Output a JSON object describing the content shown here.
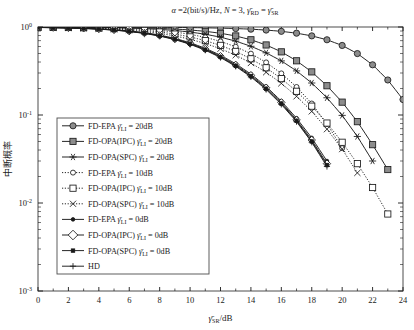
{
  "chart_data": {
    "type": "line",
    "title": "α =2(bit/s)/Hz, N = 3, γ̄RD = γ̄SR",
    "title_parts": {
      "alpha": "α",
      "rate": "=2(bit/s)/Hz,",
      "n": "N = 3,",
      "gamma_rd": "γ",
      "sub_rd": "RD",
      "eq": "=",
      "gamma_sr": "γ",
      "sub_sr": "SR"
    },
    "xlabel": "γ̄SR/dB",
    "xlabel_parts": {
      "gamma": "γ",
      "sub": "SR",
      "unit": "/dB"
    },
    "ylabel": "中断概率",
    "xlim": [
      0,
      24
    ],
    "ylim": [
      0.001,
      1
    ],
    "yscale": "log",
    "xticks": [
      0,
      2,
      4,
      6,
      8,
      10,
      12,
      14,
      16,
      18,
      20,
      22,
      24
    ],
    "xticklabels": [
      "0",
      "2",
      "4",
      "6",
      "8",
      "10",
      "12",
      "14",
      "16",
      "18",
      "20",
      "22",
      "24"
    ],
    "yticks": [
      1,
      0.1,
      0.01,
      0.001
    ],
    "yticklabels": [
      "10^0",
      "10^-1",
      "10^-2",
      "10^-3"
    ],
    "grid": false,
    "legend_position": "lower-left",
    "series": [
      {
        "name": "FD-EPA γ̄LI = 20dB",
        "label_prefix": "FD-EPA",
        "label_gamma": "γ",
        "label_sub": "LI",
        "label_value": "= 20dB",
        "marker": "circle-filled",
        "linestyle": "solid",
        "color": "#1a1a1a",
        "x": [
          0,
          1,
          2,
          3,
          4,
          5,
          6,
          7,
          8,
          9,
          10,
          11,
          12,
          13,
          14,
          15,
          16,
          17,
          18,
          19,
          20,
          21,
          22,
          23,
          24
        ],
        "y": [
          0.999,
          0.999,
          0.998,
          0.998,
          0.997,
          0.996,
          0.995,
          0.993,
          0.991,
          0.988,
          0.984,
          0.979,
          0.971,
          0.96,
          0.945,
          0.923,
          0.893,
          0.851,
          0.793,
          0.716,
          0.617,
          0.499,
          0.372,
          0.25,
          0.15
        ]
      },
      {
        "name": "FD-OPA(IPC) γ̄LI = 20dB",
        "label_prefix": "FD-OPA(IPC)",
        "label_gamma": "γ",
        "label_sub": "LI",
        "label_value": "= 20dB",
        "marker": "square-filled",
        "linestyle": "solid",
        "color": "#1a1a1a",
        "x": [
          0,
          1,
          2,
          3,
          4,
          5,
          6,
          7,
          8,
          9,
          10,
          11,
          12,
          13,
          14,
          15,
          16,
          17,
          18,
          19,
          20,
          21,
          22,
          23
        ],
        "y": [
          0.998,
          0.997,
          0.996,
          0.994,
          0.992,
          0.988,
          0.983,
          0.975,
          0.964,
          0.948,
          0.925,
          0.893,
          0.849,
          0.791,
          0.716,
          0.625,
          0.522,
          0.413,
          0.309,
          0.215,
          0.14,
          0.084,
          0.046,
          0.024
        ]
      },
      {
        "name": "FD-OPA(SPC) γ̄LI = 20dB",
        "label_prefix": "FD-OPA(SPC)",
        "label_gamma": "γ",
        "label_sub": "LI",
        "label_value": "= 20dB",
        "marker": "star",
        "linestyle": "solid",
        "color": "#1a1a1a",
        "x": [
          0,
          1,
          2,
          3,
          4,
          5,
          6,
          7,
          8,
          9,
          10,
          11,
          12,
          13,
          14,
          15,
          16,
          17,
          18,
          19,
          20,
          21,
          22
        ],
        "y": [
          0.997,
          0.996,
          0.994,
          0.991,
          0.987,
          0.981,
          0.972,
          0.959,
          0.94,
          0.913,
          0.876,
          0.828,
          0.766,
          0.691,
          0.604,
          0.509,
          0.412,
          0.317,
          0.231,
          0.157,
          0.099,
          0.057,
          0.03
        ]
      },
      {
        "name": "FD-EPA γ̄LI = 10dB",
        "label_prefix": "FD-EPA",
        "label_gamma": "γ",
        "label_sub": "LI",
        "label_value": "= 10dB",
        "marker": "circle-open",
        "linestyle": "dotted",
        "color": "#1a1a1a",
        "x": [
          0,
          1,
          2,
          3,
          4,
          5,
          6,
          7,
          8,
          9,
          10,
          11,
          12,
          13,
          14,
          15,
          16,
          17,
          18,
          19,
          20
        ],
        "y": [
          0.996,
          0.994,
          0.991,
          0.987,
          0.981,
          0.972,
          0.959,
          0.94,
          0.913,
          0.876,
          0.827,
          0.763,
          0.686,
          0.596,
          0.498,
          0.396,
          0.297,
          0.208,
          0.135,
          0.079,
          0.042
        ]
      },
      {
        "name": "FD-OPA(IPC) γ̄LI = 10dB",
        "label_prefix": "FD-OPA(IPC)",
        "label_gamma": "γ",
        "label_sub": "LI",
        "label_value": "= 10dB",
        "marker": "square-open",
        "linestyle": "dotted",
        "color": "#1a1a1a",
        "x": [
          0,
          1,
          2,
          3,
          4,
          5,
          6,
          7,
          8,
          9,
          10,
          11,
          12,
          13,
          14,
          15,
          16,
          17,
          18,
          19,
          20,
          21,
          22,
          23
        ],
        "y": [
          0.994,
          0.991,
          0.987,
          0.981,
          0.972,
          0.959,
          0.94,
          0.914,
          0.878,
          0.831,
          0.772,
          0.7,
          0.618,
          0.528,
          0.435,
          0.344,
          0.259,
          0.186,
          0.126,
          0.081,
          0.049,
          0.028,
          0.015,
          0.0075
        ]
      },
      {
        "name": "FD-OPA(SPC) γ̄LI = 10dB",
        "label_prefix": "FD-OPA(SPC)",
        "label_gamma": "γ",
        "label_sub": "LI",
        "label_value": "= 10dB",
        "marker": "x-cross",
        "linestyle": "dotted",
        "color": "#1a1a1a",
        "x": [
          0,
          1,
          2,
          3,
          4,
          5,
          6,
          7,
          8,
          9,
          10,
          11,
          12,
          13,
          14,
          15,
          16,
          17,
          18,
          19,
          20,
          21
        ],
        "y": [
          0.992,
          0.988,
          0.982,
          0.974,
          0.962,
          0.945,
          0.921,
          0.889,
          0.846,
          0.792,
          0.726,
          0.65,
          0.566,
          0.478,
          0.39,
          0.306,
          0.229,
          0.163,
          0.11,
          0.069,
          0.041,
          0.022
        ]
      },
      {
        "name": "FD-EPA γ̄LI = 0dB",
        "label_prefix": "FD-EPA",
        "label_gamma": "γ",
        "label_sub": "LI",
        "label_value": "= 0dB",
        "marker": "circle-small-filled",
        "linestyle": "solid",
        "color": "#1a1a1a",
        "x": [
          0,
          1,
          2,
          3,
          4,
          5,
          6,
          7,
          8,
          9,
          10,
          11,
          12,
          13,
          14,
          15,
          16,
          17,
          18,
          19
        ],
        "y": [
          0.99,
          0.985,
          0.978,
          0.968,
          0.953,
          0.932,
          0.902,
          0.862,
          0.81,
          0.743,
          0.663,
          0.573,
          0.478,
          0.382,
          0.292,
          0.211,
          0.144,
          0.092,
          0.055,
          0.03
        ]
      },
      {
        "name": "FD-OPA(IPC) γ̄LI = 0dB",
        "label_prefix": "FD-OPA(IPC)",
        "label_gamma": "γ",
        "label_sub": "LI",
        "label_value": "= 0dB",
        "marker": "diamond-open",
        "linestyle": "solid",
        "color": "#1a1a1a",
        "x": [
          0,
          1,
          2,
          3,
          4,
          5,
          6,
          7,
          8,
          9,
          10,
          11,
          12,
          13,
          14,
          15,
          16,
          17,
          18,
          19
        ],
        "y": [
          0.989,
          0.984,
          0.977,
          0.966,
          0.95,
          0.928,
          0.897,
          0.855,
          0.801,
          0.733,
          0.652,
          0.561,
          0.466,
          0.371,
          0.283,
          0.204,
          0.139,
          0.088,
          0.052,
          0.028
        ]
      },
      {
        "name": "FD-OPA(SPC) γ̄LI = 0dB",
        "label_prefix": "FD-OPA(SPC)",
        "label_gamma": "γ",
        "label_sub": "LI",
        "label_value": "= 0dB",
        "marker": "square-tiny-filled",
        "linestyle": "solid",
        "color": "#1a1a1a",
        "x": [
          0,
          1,
          2,
          3,
          4,
          5,
          6,
          7,
          8,
          9,
          10,
          11,
          12,
          13,
          14,
          15,
          16,
          17,
          18,
          19
        ],
        "y": [
          0.988,
          0.983,
          0.975,
          0.964,
          0.947,
          0.924,
          0.892,
          0.849,
          0.794,
          0.725,
          0.643,
          0.552,
          0.457,
          0.363,
          0.276,
          0.199,
          0.135,
          0.086,
          0.05,
          0.027
        ]
      },
      {
        "name": "HD",
        "label_prefix": "HD",
        "label_gamma": "",
        "label_sub": "",
        "label_value": "",
        "marker": "plus",
        "linestyle": "solid",
        "color": "#1a1a1a",
        "x": [
          0,
          1,
          2,
          3,
          4,
          5,
          6,
          7,
          8,
          9,
          10,
          11,
          12,
          13,
          14,
          15,
          16,
          17,
          18,
          19
        ],
        "y": [
          0.987,
          0.982,
          0.974,
          0.962,
          0.945,
          0.921,
          0.889,
          0.845,
          0.789,
          0.719,
          0.636,
          0.545,
          0.45,
          0.357,
          0.271,
          0.195,
          0.132,
          0.084,
          0.049,
          0.026
        ]
      }
    ]
  }
}
